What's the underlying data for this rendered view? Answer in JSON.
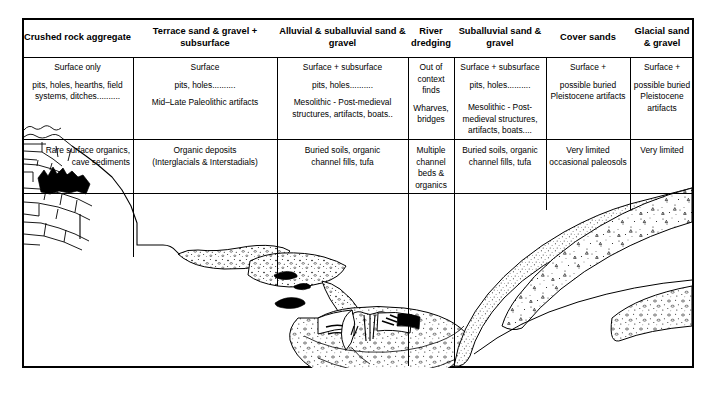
{
  "table": {
    "columns": [
      {
        "id": "crushed-rock-aggregate",
        "header": "Crushed rock aggregate",
        "header_lines": [
          "Crushed rock",
          "aggregate"
        ],
        "resource_lines": [
          "Surface only",
          "pits, holes, hearths, field systems, ditches.........."
        ],
        "deposit_lines": [
          "Rare surface organics,",
          "cave sediments"
        ],
        "align": "right"
      },
      {
        "id": "terrace-sand-gravel",
        "header": "Terrace sand & gravel + subsurface",
        "header_lines": [
          "Terrace sand & gravel",
          "+ subsurface"
        ],
        "resource_lines": [
          "Surface",
          "pits, holes..........",
          "Mid–Late Paleolithic artifacts"
        ],
        "deposit_lines": [
          "Organic deposits",
          "(Interglacials & Interstadials)"
        ],
        "align": "center"
      },
      {
        "id": "alluvial-suballuvial-sand-gravel",
        "header": "Alluvial & suballuvial sand & gravel",
        "header_lines": [
          "Alluvial & suballuvial",
          "sand & gravel"
        ],
        "resource_lines": [
          "Surface + subsurface",
          "pits, holes..........",
          "Mesolithic - Post-medieval structures, artifacts, boats.."
        ],
        "deposit_lines": [
          "Buried soils, organic",
          "channel fills, tufa"
        ],
        "align": "center"
      },
      {
        "id": "river-dredging",
        "header": "River dredging",
        "header_lines": [
          "River",
          "dredging"
        ],
        "resource_lines": [
          "Out of context finds",
          "Wharves, bridges"
        ],
        "deposit_lines": [
          "Multiple channel beds & organics"
        ],
        "align": "center"
      },
      {
        "id": "suballuvial-sand-gravel",
        "header": "Suballuvial sand & gravel",
        "header_lines": [
          "Suballuvial",
          "sand & gravel"
        ],
        "resource_lines": [
          "Surface + subsurface",
          "pits, holes..........",
          "Mesolithic - Post-medieval structures, artifacts, boats...."
        ],
        "deposit_lines": [
          "Buried soils, organic",
          "channel fills, tufa"
        ],
        "align": "center"
      },
      {
        "id": "cover-sands",
        "header": "Cover sands",
        "header_lines": [
          "Cover sands"
        ],
        "resource_lines": [
          "Surface +",
          "possible buried Pleistocene artifacts"
        ],
        "deposit_lines": [
          "Very limited",
          "occasional paleosols"
        ],
        "align": "center"
      },
      {
        "id": "glacial-sand-gravel",
        "header": "Glacial sand & gravel",
        "header_lines": [
          "Glacial sand",
          "& gravel"
        ],
        "resource_lines": [
          "Surface +",
          "possible buried Pleistocene artifacts"
        ],
        "deposit_lines": [
          "Very limited"
        ],
        "align": "center"
      }
    ]
  },
  "section": {
    "features": [
      {
        "id": "quarry-face",
        "label": "Crushed rock quarry face with jointed bedrock"
      },
      {
        "id": "cave-sediment",
        "label": "Black cave / fissure sediment"
      },
      {
        "id": "upper-terrace-gravel",
        "label": "Upper terrace sand & gravel"
      },
      {
        "id": "lower-terrace-gravel",
        "label": "Lower terrace sand & gravel with organic channel fills"
      },
      {
        "id": "organic-channel-fill",
        "label": "Organic channel fill lens"
      },
      {
        "id": "floodplain-alluvium",
        "label": "Floodplain alluvium over suballuvial sand & gravel"
      },
      {
        "id": "river-channel",
        "label": "River channel water surface"
      },
      {
        "id": "bridge-piles",
        "label": "Bridge piles / wharf structure"
      },
      {
        "id": "buried-boat",
        "label": "Buried boat"
      },
      {
        "id": "cover-sand-body",
        "label": "Cover sands"
      },
      {
        "id": "glacial-sand-gravel-body",
        "label": "Glacial sand & gravel with clasts"
      }
    ]
  },
  "colors": {
    "line": "#000000",
    "background": "#ffffff",
    "fill_dark": "#000000",
    "stipple": "#222222"
  }
}
